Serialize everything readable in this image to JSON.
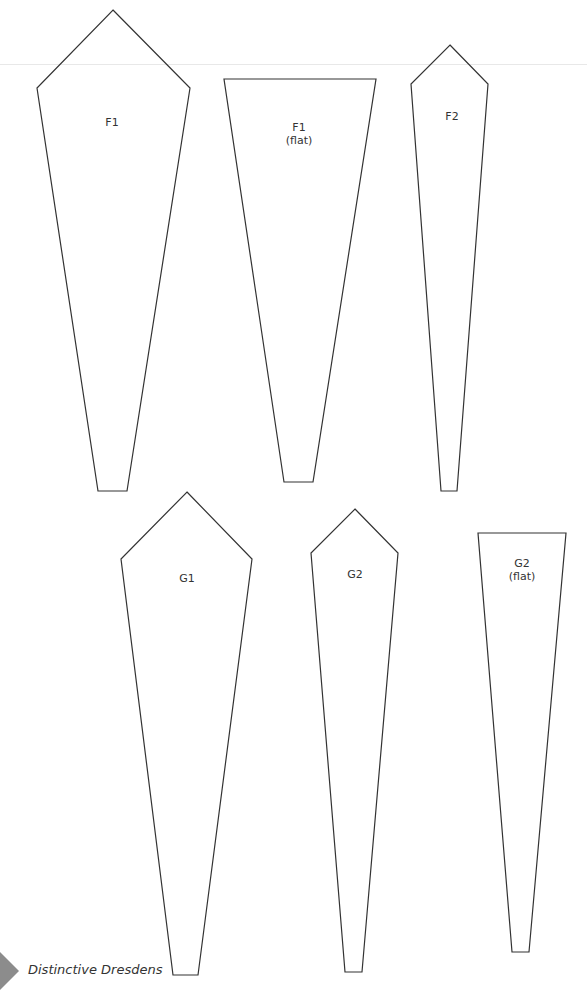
{
  "page": {
    "footer": {
      "running_title": "Distinctive Dresdens",
      "tab_color": "#8c8c8c"
    },
    "line_color": "#333333",
    "templates": [
      {
        "id": "F1",
        "label": "F1",
        "sublabel": "",
        "points": "113,10 190,88 127,491 98,491 37,88",
        "label_x": 112,
        "label_y": 116
      },
      {
        "id": "F1-flat",
        "label": "F1",
        "sublabel": "(flat)",
        "points": "224,79 376,79 313,482 284,482",
        "label_x": 299,
        "label_y": 121
      },
      {
        "id": "F2",
        "label": "F2",
        "sublabel": "",
        "points": "450,45 488,84 457,491 441,491 411,84",
        "label_x": 452,
        "label_y": 110
      },
      {
        "id": "G1",
        "label": "G1",
        "sublabel": "",
        "points": "187,492 252,559 198,975 173,975 121,559",
        "label_x": 187,
        "label_y": 572
      },
      {
        "id": "G2",
        "label": "G2",
        "sublabel": "",
        "points": "355,509 398,553 362,972 345,972 311,553",
        "label_x": 355,
        "label_y": 568
      },
      {
        "id": "G2-flat",
        "label": "G2",
        "sublabel": "(flat)",
        "points": "478,533 566,533 529,952 512,952",
        "label_x": 522,
        "label_y": 557
      }
    ]
  }
}
